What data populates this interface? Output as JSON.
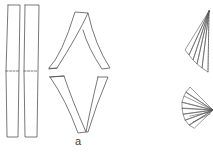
{
  "figure": {
    "label": "a",
    "stroke_color": "#555555",
    "background": "#ffffff",
    "parts": [
      {
        "name": "two straight paper strips with dashed fold line"
      },
      {
        "name": "strips folded into diamond shape"
      },
      {
        "name": "pleated fan upper"
      },
      {
        "name": "pleated fan lower"
      }
    ]
  }
}
